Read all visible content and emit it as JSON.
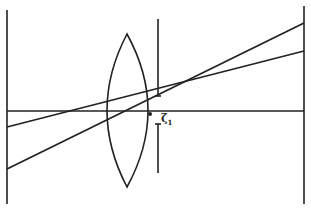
{
  "diagram": {
    "type": "optics-ray-diagram",
    "stroke_color": "#222222",
    "background": "#ffffff",
    "left_plane": {
      "x": 7,
      "y1": 10,
      "y2": 204
    },
    "right_plane": {
      "x": 304,
      "y1": 6,
      "y2": 204
    },
    "optical_axis": {
      "y": 111,
      "x1": 7,
      "x2": 304
    },
    "lens": {
      "cx": 127,
      "top_y": 34,
      "bottom_y": 187,
      "left_x": 107,
      "right_x": 148
    },
    "aperture_stop": {
      "x": 158,
      "upper": {
        "y1": 19,
        "y2": 96
      },
      "lower": {
        "y1": 124,
        "y2": 173
      },
      "cap_half_width": 3
    },
    "focal_point": {
      "x": 150,
      "y": 114
    },
    "rays": [
      {
        "name": "ray-upper",
        "x1": 7,
        "y1": 127,
        "x2": 304,
        "y2": 51
      },
      {
        "name": "ray-lower",
        "x1": 7,
        "y1": 169,
        "x2": 304,
        "y2": 23
      }
    ],
    "label": {
      "symbol": "ζ",
      "subscript": "1",
      "x": 161,
      "y": 117
    }
  }
}
